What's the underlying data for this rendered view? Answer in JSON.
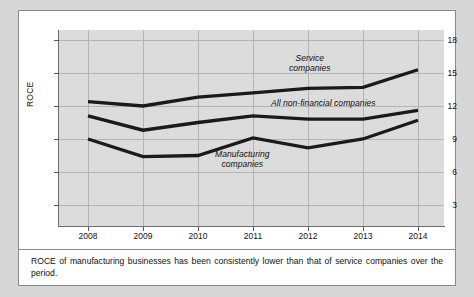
{
  "figure": {
    "caption": "ROCE of manufacturing businesses has been consistently lower than that of service companies over the period."
  },
  "chart_data": {
    "type": "line",
    "title": "",
    "xlabel": "",
    "ylabel": "ROCE",
    "categories": [
      "2008",
      "2009",
      "2010",
      "2011",
      "2012",
      "2013",
      "2014"
    ],
    "x": [
      2008,
      2009,
      2010,
      2011,
      2012,
      2013,
      2014
    ],
    "ylim": [
      0,
      18
    ],
    "yticks": [
      3,
      6,
      9,
      12,
      15,
      18
    ],
    "ytick_labels": [
      "3",
      "6",
      "9",
      "12",
      "15",
      "18"
    ],
    "grid": true,
    "legend_position": "inline-annotations",
    "series": [
      {
        "name": "Service companies",
        "values": [
          12.4,
          12.0,
          12.8,
          13.2,
          13.6,
          13.7,
          15.3
        ],
        "color": "#1a1a1a"
      },
      {
        "name": "All non-financial companies",
        "values": [
          11.1,
          9.8,
          10.5,
          11.1,
          10.8,
          10.8,
          11.6
        ],
        "color": "#1a1a1a"
      },
      {
        "name": "Manufacturing companies",
        "values": [
          9.0,
          7.4,
          7.5,
          9.1,
          8.2,
          9.0,
          10.7
        ],
        "color": "#1a1a1a"
      }
    ],
    "annotations": [
      {
        "id": "service",
        "line1": "Service",
        "line2": "companies"
      },
      {
        "id": "all_non_financial",
        "line1": "All non-financial companies",
        "line2": ""
      },
      {
        "id": "manufacturing",
        "line1": "Manufacturing",
        "line2": "companies"
      }
    ]
  }
}
